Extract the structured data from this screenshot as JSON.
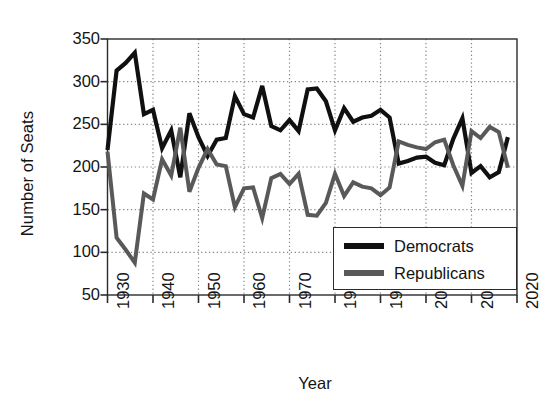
{
  "chart_data": {
    "type": "line",
    "title": "",
    "xlabel": "Year",
    "ylabel": "Number of Seats",
    "xlim": [
      1930,
      2020
    ],
    "ylim": [
      50,
      350
    ],
    "xticks": [
      1930,
      1940,
      1950,
      1960,
      1970,
      1980,
      1990,
      2000,
      2010,
      2020
    ],
    "yticks": [
      50,
      100,
      150,
      200,
      250,
      300,
      350
    ],
    "grid": true,
    "grid_style": "dotted",
    "legend_position": "bottom-right",
    "x": [
      1930,
      1932,
      1934,
      1936,
      1938,
      1940,
      1942,
      1944,
      1946,
      1948,
      1950,
      1952,
      1954,
      1956,
      1958,
      1960,
      1962,
      1964,
      1966,
      1968,
      1970,
      1972,
      1974,
      1976,
      1978,
      1980,
      1982,
      1984,
      1986,
      1988,
      1990,
      1992,
      1994,
      1996,
      1998,
      2000,
      2002,
      2004,
      2006,
      2008,
      2010,
      2012,
      2014,
      2016,
      2018
    ],
    "series": [
      {
        "name": "Democrats",
        "color": "#101010",
        "values": [
          220,
          313,
          322,
          334,
          262,
          267,
          222,
          243,
          188,
          263,
          235,
          213,
          232,
          234,
          283,
          262,
          258,
          295,
          248,
          243,
          255,
          242,
          291,
          292,
          277,
          243,
          269,
          253,
          258,
          260,
          267,
          258,
          204,
          207,
          211,
          212,
          205,
          202,
          233,
          257,
          193,
          201,
          188,
          194,
          235
        ]
      },
      {
        "name": "Republicans",
        "color": "#595959",
        "values": [
          218,
          117,
          103,
          88,
          169,
          162,
          209,
          190,
          246,
          171,
          199,
          221,
          203,
          201,
          153,
          175,
          176,
          140,
          187,
          192,
          180,
          192,
          144,
          143,
          158,
          192,
          166,
          182,
          177,
          175,
          167,
          176,
          230,
          226,
          223,
          221,
          229,
          232,
          202,
          178,
          242,
          234,
          247,
          241,
          199
        ]
      }
    ]
  },
  "legend": {
    "items": [
      {
        "label": "Democrats",
        "color": "#101010"
      },
      {
        "label": "Republicans",
        "color": "#595959"
      }
    ]
  },
  "axis": {
    "ylabel": "Number of Seats",
    "xlabel": "Year",
    "ytick_labels": [
      "350",
      "300",
      "250",
      "200",
      "150",
      "100",
      "50"
    ],
    "xtick_labels": [
      "1930",
      "1940",
      "1950",
      "1960",
      "1970",
      "1980",
      "1990",
      "2000",
      "2010",
      "2020"
    ]
  },
  "colors": {
    "democrat": "#101010",
    "republican": "#595959",
    "axis": "#2b2b2b",
    "grid": "#888888",
    "background": "#ffffff"
  }
}
